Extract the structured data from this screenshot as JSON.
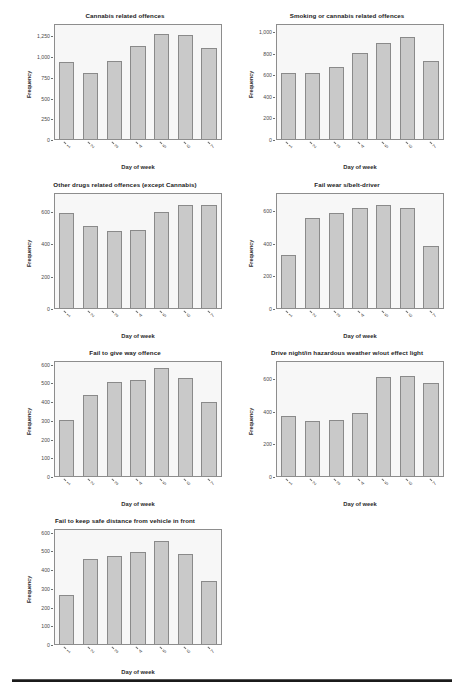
{
  "page": {
    "width": 462,
    "height": 694,
    "background_color": "#ffffff",
    "bar_fill_color": "#c9c9c9",
    "bar_border_color": "#8a8a8a",
    "plot_background_color": "#f7f7f7",
    "axis_color": "#8d8d8d"
  },
  "common": {
    "xlabel": "Day of week",
    "ylabel": "Frequency",
    "categories": [
      "1",
      "2",
      "3",
      "4",
      "5",
      "6",
      "7"
    ]
  },
  "chart_data": [
    {
      "id": "cannabis-related-offences",
      "type": "bar",
      "title": "Cannabis related offences",
      "xlabel": "Day of week",
      "ylabel": "Frequency",
      "categories": [
        "1",
        "2",
        "3",
        "4",
        "5",
        "6",
        "7"
      ],
      "values": [
        940,
        810,
        955,
        1140,
        1285,
        1275,
        1120
      ],
      "ylim": [
        0,
        1400
      ],
      "yticks": [
        0,
        250,
        500,
        750,
        1000,
        1250
      ],
      "ytick_labels": [
        "0",
        "250",
        "500",
        "750",
        "1,000",
        "1,250"
      ],
      "grid": false,
      "legend": "none"
    },
    {
      "id": "smoking-or-cannabis-related-offences",
      "type": "bar",
      "title": "Smoking or cannabis related offences",
      "xlabel": "Day of week",
      "ylabel": "Frequency",
      "categories": [
        "1",
        "2",
        "3",
        "4",
        "5",
        "6",
        "7"
      ],
      "values": [
        625,
        620,
        680,
        815,
        910,
        965,
        735
      ],
      "ylim": [
        0,
        1075
      ],
      "yticks": [
        0,
        200,
        400,
        600,
        800,
        1000
      ],
      "ytick_labels": [
        "0",
        "200",
        "400",
        "600",
        "800",
        "1,000"
      ],
      "grid": false,
      "legend": "none"
    },
    {
      "id": "other-drugs-related-offences",
      "type": "bar",
      "title": "Other drugs related offences (except Cannabis)",
      "xlabel": "Day of week",
      "ylabel": "Frequency",
      "categories": [
        "1",
        "2",
        "3",
        "4",
        "5",
        "6",
        "7"
      ],
      "values": [
        597,
        515,
        485,
        492,
        600,
        645,
        645
      ],
      "ylim": [
        0,
        715
      ],
      "yticks": [
        0,
        200,
        400,
        600
      ],
      "ytick_labels": [
        "0",
        "200",
        "400",
        "600"
      ],
      "grid": false,
      "legend": "none"
    },
    {
      "id": "fail-wear-seatbelt-driver",
      "type": "bar",
      "title": "Fail wear s/belt-driver",
      "xlabel": "Day of week",
      "ylabel": "Frequency",
      "categories": [
        "1",
        "2",
        "3",
        "4",
        "5",
        "6",
        "7"
      ],
      "values": [
        330,
        558,
        590,
        620,
        640,
        620,
        385
      ],
      "ylim": [
        0,
        710
      ],
      "yticks": [
        0,
        200,
        400,
        600
      ],
      "ytick_labels": [
        "0",
        "200",
        "400",
        "600"
      ],
      "grid": false,
      "legend": "none"
    },
    {
      "id": "fail-to-give-way-offence",
      "type": "bar",
      "title": "Fail to give way offence",
      "xlabel": "Day of week",
      "ylabel": "Frequency",
      "categories": [
        "1",
        "2",
        "3",
        "4",
        "5",
        "6",
        "7"
      ],
      "values": [
        305,
        442,
        512,
        523,
        588,
        535,
        402
      ],
      "ylim": [
        0,
        620
      ],
      "yticks": [
        0,
        100,
        200,
        300,
        400,
        500,
        600
      ],
      "ytick_labels": [
        "0",
        "100",
        "200",
        "300",
        "400",
        "500",
        "600"
      ],
      "grid": false,
      "legend": "none"
    },
    {
      "id": "drive-night-hazardous-weather",
      "type": "bar",
      "title": "Drive night/in hazardous weather w/out effect light",
      "xlabel": "Day of week",
      "ylabel": "Frequency",
      "categories": [
        "1",
        "2",
        "3",
        "4",
        "5",
        "6",
        "7"
      ],
      "values": [
        375,
        342,
        348,
        395,
        615,
        620,
        580
      ],
      "ylim": [
        0,
        710
      ],
      "yticks": [
        0,
        200,
        400,
        600
      ],
      "ytick_labels": [
        "0",
        "200",
        "400",
        "600"
      ],
      "grid": false,
      "legend": "none"
    },
    {
      "id": "fail-keep-safe-distance",
      "type": "bar",
      "title": "Fail to keep safe distance from vehicle in front",
      "xlabel": "Day of week",
      "ylabel": "Frequency",
      "categories": [
        "1",
        "2",
        "3",
        "4",
        "5",
        "6",
        "7"
      ],
      "values": [
        267,
        462,
        480,
        498,
        558,
        490,
        345
      ],
      "ylim": [
        0,
        620
      ],
      "yticks": [
        0,
        100,
        200,
        300,
        400,
        500,
        600
      ],
      "ytick_labels": [
        "0",
        "100",
        "200",
        "300",
        "400",
        "500",
        "600"
      ],
      "grid": false,
      "legend": "none"
    }
  ]
}
